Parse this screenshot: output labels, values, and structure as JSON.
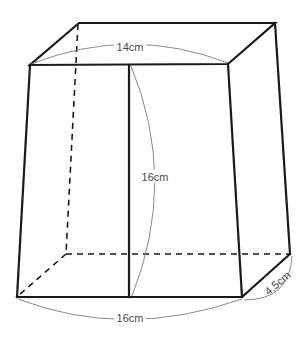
{
  "figure": {
    "type": "rectangular prism with dividing line",
    "colors": {
      "edge": "#1a1a1a",
      "dimension_arc": "#7a7a7a",
      "label": "#4a4a4a",
      "background": "#ffffff"
    },
    "labels": {
      "top_width": "14cm",
      "height": "16cm",
      "bottom_width": "16cm",
      "depth": "4.5cm"
    }
  }
}
